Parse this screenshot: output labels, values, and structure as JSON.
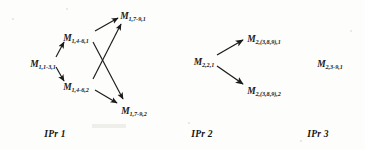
{
  "figure": {
    "type": "node-link-diagram",
    "background_color": "#fdfdfc",
    "ink_color": "#1b1b1b"
  },
  "groups": [
    {
      "id": "ipr1",
      "caption": "IPr 1",
      "nodes": [
        {
          "id": "n1",
          "base": "M",
          "sub": "1,1-3,1",
          "x": 43,
          "y": 62
        },
        {
          "id": "n2",
          "base": "M",
          "sub": "1,4-6,1",
          "x": 76,
          "y": 36
        },
        {
          "id": "n3",
          "base": "M",
          "sub": "1,4-6,2",
          "x": 76,
          "y": 85
        },
        {
          "id": "n4",
          "base": "M",
          "sub": "1,7-9,1",
          "x": 133,
          "y": 14
        },
        {
          "id": "n5",
          "base": "M",
          "sub": "1,7-9,2",
          "x": 134,
          "y": 109
        }
      ],
      "edges": [
        {
          "from": "n1",
          "to": "n2"
        },
        {
          "from": "n1",
          "to": "n3"
        },
        {
          "from": "n2",
          "to": "n4"
        },
        {
          "from": "n3",
          "to": "n4"
        },
        {
          "from": "n2",
          "to": "n5"
        },
        {
          "from": "n3",
          "to": "n5"
        }
      ]
    },
    {
      "id": "ipr2",
      "caption": "IPr 2",
      "nodes": [
        {
          "id": "m1",
          "base": "M",
          "sub": "2,2,1",
          "x": 204,
          "y": 60
        },
        {
          "id": "m2",
          "base": "M",
          "sub": "2,(3,8,9),1",
          "x": 264,
          "y": 37
        },
        {
          "id": "m3",
          "base": "M",
          "sub": "2,(3,8,9),2",
          "x": 264,
          "y": 89
        }
      ],
      "edges": [
        {
          "from": "m1",
          "to": "m2"
        },
        {
          "from": "m1",
          "to": "m3"
        }
      ]
    },
    {
      "id": "ipr3",
      "caption": "IPr 3",
      "nodes": [
        {
          "id": "k1",
          "base": "M",
          "sub": "2,3-9,1",
          "x": 330,
          "y": 62
        }
      ],
      "edges": []
    }
  ],
  "captions": [
    {
      "id": "cap1",
      "label": "IPr 1",
      "x": 55,
      "y": 134
    },
    {
      "id": "cap2",
      "label": "IPr 2",
      "x": 202,
      "y": 134
    },
    {
      "id": "cap3",
      "label": "IPr 3",
      "x": 318,
      "y": 134
    }
  ]
}
